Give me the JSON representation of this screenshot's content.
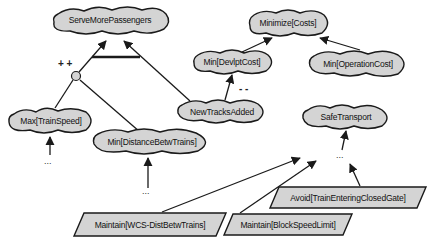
{
  "diagram": {
    "type": "goal-model",
    "colors": {
      "node_fill": "#d4d4d4",
      "stroke": "#1a1a1a",
      "background": "#ffffff"
    },
    "softgoals": [
      {
        "id": "serve",
        "label": "ServeMorePassengers"
      },
      {
        "id": "mincosts",
        "label": "Minimize[Costs]"
      },
      {
        "id": "devlpt",
        "label": "Min[DevlptCost]"
      },
      {
        "id": "operation",
        "label": "Min[OperationCost]"
      },
      {
        "id": "newtracks",
        "label": "NewTracksAdded"
      },
      {
        "id": "safe",
        "label": "SafeTransport"
      },
      {
        "id": "maxspeed",
        "label": "Max[TrainSpeed]"
      },
      {
        "id": "mindist",
        "label": "Min[DistanceBetwTrains]"
      }
    ],
    "goals": [
      {
        "id": "wcs",
        "label": "Maintain[WCS-DistBetwTrains]"
      },
      {
        "id": "block",
        "label": "Maintain[BlockSpeedLimit]"
      },
      {
        "id": "avoid",
        "label": "Avoid[TrainEnteringClosedGate]"
      }
    ],
    "contribution_labels": {
      "and_plus": "+ +",
      "newtracks_devlpt": "- -"
    },
    "ellipsis": "...",
    "links": [
      {
        "from": "maxspeed",
        "to": "serve",
        "via": "and-node",
        "contribution": "++"
      },
      {
        "from": "mindist",
        "to": "serve",
        "via": "and-node",
        "contribution": "++"
      },
      {
        "from": "newtracks",
        "to": "serve"
      },
      {
        "from": "devlpt",
        "to": "mincosts"
      },
      {
        "from": "operation",
        "to": "mincosts"
      },
      {
        "from": "newtracks",
        "to": "devlpt",
        "contribution": "--"
      },
      {
        "from": "wcs",
        "to": "safe"
      },
      {
        "from": "block",
        "to": "safe"
      },
      {
        "from": "avoid",
        "to": "safe"
      }
    ]
  }
}
